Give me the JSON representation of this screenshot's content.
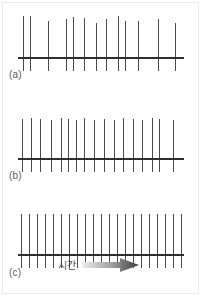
{
  "figure": {
    "background_color": "#ffffff",
    "spike_color": "#4a4a4a",
    "baseline_color": "#2f2f2f",
    "label_color": "#5a5a5a",
    "arrow_gradient_from": "#e8e8e8",
    "arrow_gradient_to": "#3a3a3a"
  },
  "axis": {
    "time_label": "시간",
    "arrow_name": "time-direction-arrow"
  },
  "panels": [
    {
      "id": "a",
      "label": "(a)",
      "description": "low firing rate, irregular spacing",
      "spike_count": 13,
      "spike_positions": [
        5,
        12,
        30,
        48,
        55,
        66,
        78,
        88,
        100,
        107,
        120,
        140,
        157
      ],
      "spike_heights": [
        55,
        55,
        50,
        52,
        54,
        53,
        48,
        52,
        55,
        50,
        50,
        52,
        48
      ]
    },
    {
      "id": "b",
      "label": "(b)",
      "description": "medium firing rate",
      "spike_count": 17,
      "spike_positions": [
        4,
        13,
        22,
        33,
        43,
        50,
        58,
        66,
        76,
        86,
        96,
        105,
        115,
        124,
        134,
        141,
        155
      ],
      "spike_heights": [
        53,
        54,
        53,
        52,
        54,
        53,
        52,
        54,
        52,
        53,
        52,
        54,
        53,
        52,
        54,
        53,
        52
      ]
    },
    {
      "id": "c",
      "label": "(c)",
      "description": "high firing rate, regular spacing",
      "spike_count": 21,
      "spike_positions": [
        3,
        11,
        19,
        27,
        35,
        43,
        51,
        59,
        67,
        75,
        83,
        91,
        99,
        107,
        115,
        123,
        131,
        139,
        147,
        155,
        163
      ],
      "spike_heights": [
        54,
        54,
        54,
        54,
        54,
        54,
        54,
        54,
        54,
        54,
        54,
        54,
        54,
        54,
        54,
        54,
        54,
        54,
        54,
        54,
        54
      ]
    }
  ],
  "chart_data": {
    "type": "raster",
    "xlabel": "시간",
    "ylabel": "",
    "grid": false,
    "legend": "none",
    "xlim": [
      0,
      165
    ],
    "ylim": [
      0,
      60
    ],
    "series": [
      {
        "name": "(a)",
        "values": [
          5,
          12,
          30,
          48,
          55,
          66,
          78,
          88,
          100,
          107,
          120,
          140,
          157
        ]
      },
      {
        "name": "(b)",
        "values": [
          4,
          13,
          22,
          33,
          43,
          50,
          58,
          66,
          76,
          86,
          96,
          105,
          115,
          124,
          134,
          141,
          155
        ]
      },
      {
        "name": "(c)",
        "values": [
          3,
          11,
          19,
          27,
          35,
          43,
          51,
          59,
          67,
          75,
          83,
          91,
          99,
          107,
          115,
          123,
          131,
          139,
          147,
          155,
          163
        ]
      }
    ]
  }
}
